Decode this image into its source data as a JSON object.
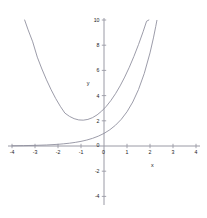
{
  "chart_data": {
    "type": "line",
    "title": "",
    "xlabel": "x",
    "ylabel": "y",
    "xlim": [
      -4,
      4
    ],
    "ylim": [
      -5,
      10
    ],
    "grid": false,
    "legend": "none",
    "background_color": "#ffffff",
    "axis_color": "#9a9aa5",
    "tick_label_color": "#1a1a1a",
    "xticks": [
      {
        "value": -4,
        "label": "-4"
      },
      {
        "value": -3,
        "label": "-3"
      },
      {
        "value": -2,
        "label": "-2"
      },
      {
        "value": -1,
        "label": "-1"
      },
      {
        "value": 0,
        "label": "0"
      },
      {
        "value": 1,
        "label": "1"
      },
      {
        "value": 2,
        "label": "2"
      },
      {
        "value": 3,
        "label": "3"
      },
      {
        "value": 4,
        "label": "4"
      }
    ],
    "yticks": [
      {
        "value": 10,
        "label": "10"
      },
      {
        "value": 8,
        "label": "8"
      },
      {
        "value": 6,
        "label": "6"
      },
      {
        "value": 4,
        "label": "4"
      },
      {
        "value": 2,
        "label": "2"
      },
      {
        "value": 0,
        "label": "0"
      },
      {
        "value": -2,
        "label": "-2"
      },
      {
        "value": -4,
        "label": "-4"
      }
    ],
    "series": [
      {
        "name": "parabola",
        "color": "#8a8a99",
        "equation": "y = x^2 + 3.4x + 4.5",
        "points": [
          [
            -3.45,
            10.0
          ],
          [
            -3.3,
            9.22
          ],
          [
            -3.1,
            8.27
          ],
          [
            -2.9,
            7.05
          ],
          [
            -2.7,
            6.11
          ],
          [
            -2.5,
            5.25
          ],
          [
            -2.3,
            4.47
          ],
          [
            -2.1,
            3.77
          ],
          [
            -1.9,
            3.15
          ],
          [
            -1.7,
            2.61
          ],
          [
            -1.5,
            2.35
          ],
          [
            -1.3,
            2.17
          ],
          [
            -1.1,
            2.07
          ],
          [
            -0.9,
            2.05
          ],
          [
            -0.7,
            2.11
          ],
          [
            -0.5,
            2.25
          ],
          [
            -0.3,
            2.47
          ],
          [
            -0.1,
            2.77
          ],
          [
            0.1,
            3.15
          ],
          [
            0.3,
            3.61
          ],
          [
            0.5,
            4.15
          ],
          [
            0.7,
            4.77
          ],
          [
            0.9,
            5.47
          ],
          [
            1.1,
            6.25
          ],
          [
            1.3,
            7.11
          ],
          [
            1.5,
            8.05
          ],
          [
            1.7,
            9.07
          ],
          [
            1.85,
            9.9
          ],
          [
            1.95,
            10.0
          ]
        ]
      },
      {
        "name": "exponential",
        "color": "#8a8a99",
        "equation": "y = e^x",
        "points": [
          [
            -4.0,
            0.018
          ],
          [
            -3.5,
            0.03
          ],
          [
            -3.0,
            0.05
          ],
          [
            -2.5,
            0.082
          ],
          [
            -2.0,
            0.135
          ],
          [
            -1.75,
            0.174
          ],
          [
            -1.5,
            0.223
          ],
          [
            -1.25,
            0.287
          ],
          [
            -1.0,
            0.368
          ],
          [
            -0.75,
            0.472
          ],
          [
            -0.5,
            0.607
          ],
          [
            -0.25,
            0.779
          ],
          [
            0.0,
            1.0
          ],
          [
            0.25,
            1.284
          ],
          [
            0.5,
            1.649
          ],
          [
            0.75,
            2.117
          ],
          [
            1.0,
            2.718
          ],
          [
            1.25,
            3.49
          ],
          [
            1.5,
            4.482
          ],
          [
            1.75,
            5.755
          ],
          [
            2.0,
            7.389
          ],
          [
            2.15,
            8.58
          ],
          [
            2.25,
            9.49
          ],
          [
            2.3,
            9.97
          ]
        ]
      }
    ]
  },
  "axis_labels": {
    "x": "x",
    "y": "y"
  }
}
